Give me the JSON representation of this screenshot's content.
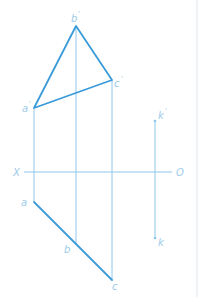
{
  "diagram": {
    "type": "orthographic-projection",
    "axis": {
      "left_label": "X",
      "right_label": "O"
    },
    "front_view": {
      "vertices": [
        {
          "id": "a_prime",
          "label": "a",
          "mark": "'"
        },
        {
          "id": "b_prime",
          "label": "b",
          "mark": "'"
        },
        {
          "id": "c_prime",
          "label": "c",
          "mark": "'"
        }
      ]
    },
    "top_view": {
      "vertices": [
        {
          "id": "a",
          "label": "a"
        },
        {
          "id": "b",
          "label": "b"
        },
        {
          "id": "c",
          "label": "c"
        }
      ]
    },
    "point_k": {
      "front": {
        "label": "k",
        "mark": "'"
      },
      "top": {
        "label": "k"
      }
    },
    "colors": {
      "object_line": "#3a9bd9",
      "projection_line": "#8ec7ea",
      "label": "#9ccbea"
    }
  }
}
